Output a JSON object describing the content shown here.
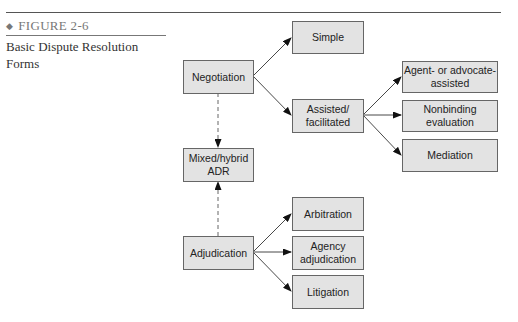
{
  "figure": {
    "number_label": "FIGURE 2-6",
    "bullet": "◆",
    "caption": "Basic Dispute Resolution Forms"
  },
  "diagram": {
    "nodes": {
      "negotiation": "Negotiation",
      "simple": "Simple",
      "assisted": "Assisted/ facilitated",
      "agent": "Agent- or advocate-assisted",
      "nonbinding": "Nonbinding evaluation",
      "mediation": "Mediation",
      "mixed": "Mixed/hybrid ADR",
      "adjudication": "Adjudication",
      "arbitration": "Arbitration",
      "agency": "Agency adjudication",
      "litigation": "Litigation"
    },
    "edges": [
      {
        "from": "negotiation",
        "to": "simple",
        "style": "solid"
      },
      {
        "from": "negotiation",
        "to": "assisted",
        "style": "solid"
      },
      {
        "from": "assisted",
        "to": "agent",
        "style": "solid"
      },
      {
        "from": "assisted",
        "to": "nonbinding",
        "style": "solid"
      },
      {
        "from": "assisted",
        "to": "mediation",
        "style": "solid"
      },
      {
        "from": "negotiation",
        "to": "mixed",
        "style": "dashed"
      },
      {
        "from": "adjudication",
        "to": "mixed",
        "style": "dashed"
      },
      {
        "from": "adjudication",
        "to": "arbitration",
        "style": "solid"
      },
      {
        "from": "adjudication",
        "to": "agency",
        "style": "solid"
      },
      {
        "from": "adjudication",
        "to": "litigation",
        "style": "solid"
      }
    ]
  }
}
